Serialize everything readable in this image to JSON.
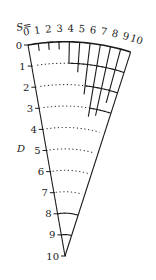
{
  "figure": {
    "s_axis_prefix": "S=",
    "s_labels": [
      "0",
      "1",
      "2",
      "3",
      "4",
      "5",
      "6",
      "7",
      "8",
      "9",
      "10"
    ],
    "d_axis_label": "D",
    "d_labels": [
      "0",
      "1",
      "2",
      "3",
      "4",
      "5",
      "6",
      "7",
      "8",
      "9",
      "10"
    ],
    "colors": {
      "line": "#1a1a1a",
      "text": "#222222",
      "background": "#ffffff"
    },
    "geometry": {
      "apex": [
        65,
        256
      ],
      "top_left": [
        28,
        45
      ],
      "top_right": [
        130,
        54
      ],
      "d_levels": [
        0,
        1,
        2,
        3,
        4,
        5,
        6,
        7,
        8,
        9,
        10
      ],
      "dotted_arcs": [
        1,
        2,
        3,
        4,
        5,
        6,
        7
      ],
      "solid_arcs": [
        0,
        8,
        9
      ],
      "s_ticks": [
        {
          "s": 0,
          "to_d": 0
        },
        {
          "s": 1,
          "to_d": 0.35
        },
        {
          "s": 2,
          "to_d": 0.35
        },
        {
          "s": 3,
          "to_d": 0.35
        },
        {
          "s": 4,
          "to_d": 1.0
        },
        {
          "s": 5,
          "to_d": 1.4
        },
        {
          "s": 6,
          "to_d": 2.4
        },
        {
          "s": 7,
          "to_d": 3.4
        },
        {
          "s": 8,
          "to_d": 3.3
        },
        {
          "s": 9,
          "to_d": 2.6
        },
        {
          "s": 10,
          "to_d": 10
        }
      ],
      "short_arc_segments": [
        {
          "d": 1,
          "from_s": 4,
          "to_s": 10
        },
        {
          "d": 2,
          "from_s": 6,
          "to_s": 10
        },
        {
          "d": 3,
          "from_s": 7,
          "to_s": 10
        }
      ]
    }
  }
}
